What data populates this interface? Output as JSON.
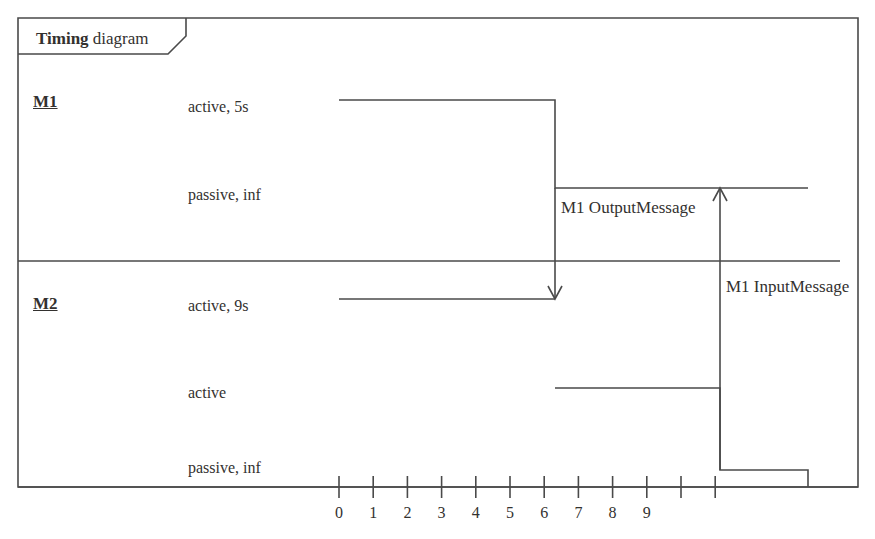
{
  "frame": {
    "tab_keyword": "Timing",
    "tab_text": " diagram",
    "x": 18,
    "y": 18,
    "width": 840,
    "height": 469,
    "tab_width": 168,
    "tab_height": 36,
    "tab_slant": 18,
    "border_color": "#4a4a4a"
  },
  "divider": {
    "y": 261,
    "x_start": 18,
    "x_end": 840
  },
  "lifelines": [
    {
      "name": "M1",
      "name_y": 93,
      "states": [
        {
          "label": "active, 5s",
          "y": 100,
          "text_y": 99
        },
        {
          "label": "passive, inf",
          "y": 188,
          "text_y": 187
        }
      ]
    },
    {
      "name": "M2",
      "name_y": 295,
      "states": [
        {
          "label": "active, 9s",
          "y": 299,
          "text_y": 298
        },
        {
          "label": "active",
          "y": 388,
          "text_y": 385
        },
        {
          "label": "passive, inf",
          "y": 470,
          "text_y": 460
        }
      ]
    }
  ],
  "waveforms": {
    "m1": "M 339 100 L 555 100 L 555 188 L 808 188",
    "m2_active9s": "M 339 299 L 555 299",
    "m2_lower": "M 555 388 L 720 388 L 720 470 L 808 470 L 808 487"
  },
  "messages": [
    {
      "label": "M1 OutputMessage",
      "label_x": 561,
      "label_y": 199,
      "from_x": 555,
      "from_y": 188,
      "to_x": 555,
      "to_y": 299,
      "direction": "down"
    },
    {
      "label": "M1 InputMessage",
      "label_x": 726,
      "label_y": 278,
      "from_x": 720,
      "from_y": 470,
      "to_x": 720,
      "to_y": 188,
      "direction": "up"
    }
  ],
  "time_axis": {
    "y": 487,
    "x_start": 18,
    "x_end": 858,
    "origin_x": 339,
    "spacing": 34.2,
    "tick_height": 11,
    "label_y": 505,
    "ticks": [
      {
        "value": "0",
        "show_label": true
      },
      {
        "value": "1",
        "show_label": true
      },
      {
        "value": "2",
        "show_label": true
      },
      {
        "value": "3",
        "show_label": true
      },
      {
        "value": "4",
        "show_label": true
      },
      {
        "value": "5",
        "show_label": true
      },
      {
        "value": "6",
        "show_label": true
      },
      {
        "value": "7",
        "show_label": true
      },
      {
        "value": "8",
        "show_label": true
      },
      {
        "value": "9",
        "show_label": true
      },
      {
        "value": "",
        "show_label": false
      },
      {
        "value": "",
        "show_label": false
      }
    ]
  },
  "colors": {
    "line": "#4a4a4a",
    "text": "#33312f",
    "background": "#ffffff"
  }
}
